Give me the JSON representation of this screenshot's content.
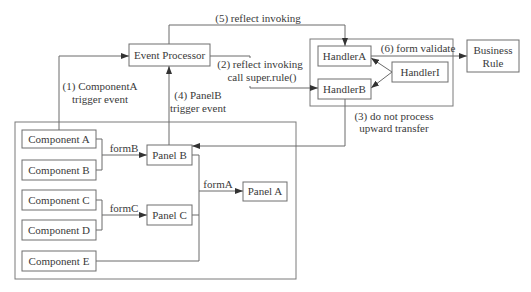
{
  "diagram": {
    "nodes": {
      "event_processor": "Event Processor",
      "component_a": "Component A",
      "component_b": "Component B",
      "component_c": "Component C",
      "component_d": "Component D",
      "component_e": "Component E",
      "panel_a": "Panel A",
      "panel_b": "Panel B",
      "panel_c": "Panel C",
      "handler_a": "HandlerA",
      "handler_b": "HandlerB",
      "handler_i": "HandlerI",
      "business_rule_line1": "Business",
      "business_rule_line2": "Rule"
    },
    "edges": {
      "step1_line1": "(1) ComponentA",
      "step1_line2": "trigger event",
      "step2_line1": "(2) reflect invoking",
      "step2_line2": "call super.rule()",
      "step3_line1": "(3) do not process",
      "step3_line2": "upward transfer",
      "step4_line1": "(4) PanelB",
      "step4_line2": "trigger event",
      "step5": "(5) reflect invoking",
      "step6": "(6) form validate",
      "form_b": "formB",
      "form_c": "formC",
      "form_a": "formA"
    }
  }
}
